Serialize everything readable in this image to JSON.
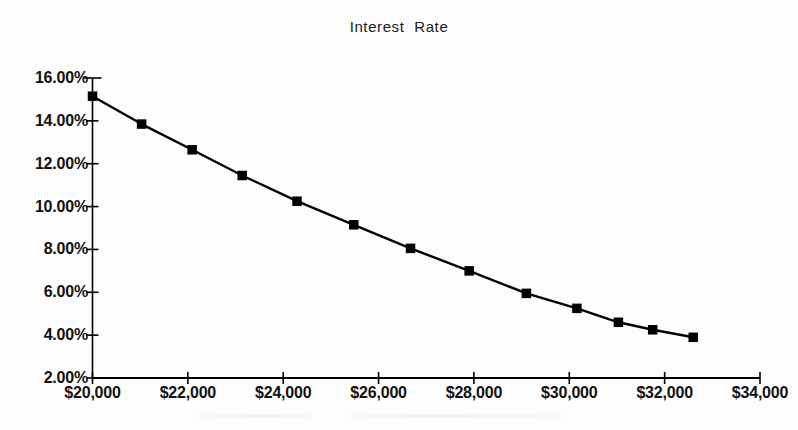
{
  "chart_data": {
    "type": "line",
    "title": "Interest  Rate",
    "xlabel": "",
    "ylabel": "",
    "grid": false,
    "legend": null,
    "xlim": [
      20000,
      34000
    ],
    "ylim": [
      2,
      16
    ],
    "x_tick_labels": [
      "$20,000",
      "$22,000",
      "$24,000",
      "$26,000",
      "$28,000",
      "$30,000",
      "$32,000",
      "$34,000"
    ],
    "x_tick_values": [
      20000,
      22000,
      24000,
      26000,
      28000,
      30000,
      32000,
      34000
    ],
    "y_tick_labels": [
      "16.00%",
      "14.00%",
      "12.00%",
      "10.00%",
      "8.00%",
      "6.00%",
      "4.00%",
      "2.00%"
    ],
    "y_tick_values": [
      16,
      14,
      12,
      10,
      8,
      6,
      4,
      2
    ],
    "series": [
      {
        "name": "Interest Rate",
        "marker": "filled-square",
        "color": "#000000",
        "x": [
          20000,
          21030,
          22090,
          23140,
          24290,
          25480,
          26670,
          27900,
          29100,
          30160,
          31030,
          31750,
          32600
        ],
        "y": [
          15.15,
          13.85,
          12.65,
          11.45,
          10.25,
          9.15,
          8.05,
          7.0,
          5.95,
          5.25,
          4.6,
          4.25,
          3.9
        ]
      }
    ]
  },
  "axes": {
    "y_axis_color": "#000000",
    "x_axis_color": "#000000"
  }
}
